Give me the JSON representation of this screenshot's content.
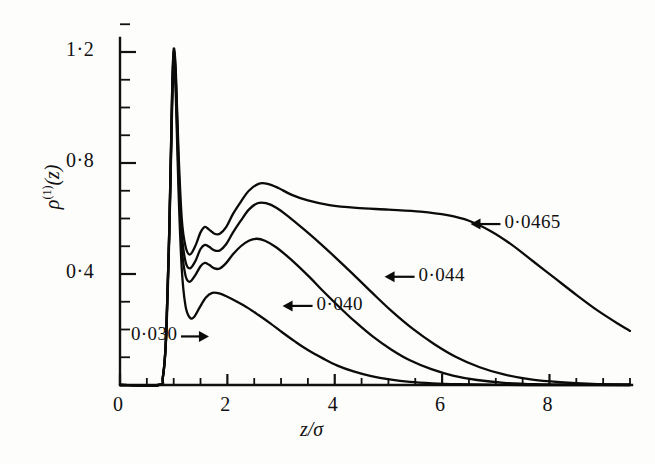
{
  "figure": {
    "name": "density-profile-figure",
    "background": "#fdfdfb",
    "ink_color": "#0b0b0b"
  },
  "axes": {
    "ylabel_rho": "ρ",
    "ylabel_superscript": "(1)",
    "ylabel_arg": "(z)",
    "xlabel": "z/σ",
    "x_ticks_major": [
      "0",
      "2",
      "4",
      "6",
      "8"
    ],
    "y_ticks_major": [
      "0·4",
      "0·8",
      "1·2"
    ]
  },
  "chart_data": {
    "type": "line",
    "title": "",
    "xlabel": "z/σ",
    "ylabel": "ρ(1)(z)",
    "xlim": [
      0,
      9.5
    ],
    "ylim": [
      0,
      1.3
    ],
    "grid": false,
    "legend_position": "inline-arrow-annotations",
    "x_major_ticks": [
      0,
      2,
      4,
      6,
      8
    ],
    "x_minor_tick_step": 0.5,
    "y_major_ticks": [
      0.4,
      0.8,
      1.2
    ],
    "y_minor_tick_step": 0.1,
    "series": [
      {
        "name": "0·0465",
        "label": "0·0465",
        "label_x": 7.05,
        "label_y": 0.58,
        "arrow_direction": "left",
        "points": [
          [
            0.0,
            0.0
          ],
          [
            0.72,
            0.0
          ],
          [
            0.8,
            0.03
          ],
          [
            0.86,
            0.18
          ],
          [
            0.92,
            0.58
          ],
          [
            0.97,
            1.05
          ],
          [
            1.0,
            1.21
          ],
          [
            1.04,
            1.13
          ],
          [
            1.09,
            0.84
          ],
          [
            1.15,
            0.6
          ],
          [
            1.22,
            0.5
          ],
          [
            1.3,
            0.47
          ],
          [
            1.4,
            0.5
          ],
          [
            1.5,
            0.55
          ],
          [
            1.58,
            0.57
          ],
          [
            1.66,
            0.56
          ],
          [
            1.76,
            0.545
          ],
          [
            1.86,
            0.545
          ],
          [
            1.98,
            0.57
          ],
          [
            2.1,
            0.615
          ],
          [
            2.25,
            0.66
          ],
          [
            2.4,
            0.7
          ],
          [
            2.58,
            0.725
          ],
          [
            2.75,
            0.725
          ],
          [
            2.95,
            0.71
          ],
          [
            3.2,
            0.685
          ],
          [
            3.5,
            0.665
          ],
          [
            3.9,
            0.648
          ],
          [
            4.4,
            0.638
          ],
          [
            5.0,
            0.632
          ],
          [
            5.6,
            0.625
          ],
          [
            6.1,
            0.612
          ],
          [
            6.5,
            0.592
          ],
          [
            6.9,
            0.555
          ],
          [
            7.3,
            0.505
          ],
          [
            7.7,
            0.445
          ],
          [
            8.1,
            0.385
          ],
          [
            8.5,
            0.325
          ],
          [
            8.9,
            0.268
          ],
          [
            9.3,
            0.218
          ],
          [
            9.5,
            0.195
          ]
        ]
      },
      {
        "name": "0·044",
        "label": "0·044",
        "label_x": 5.45,
        "label_y": 0.39,
        "arrow_direction": "left",
        "points": [
          [
            0.0,
            0.0
          ],
          [
            0.72,
            0.0
          ],
          [
            0.8,
            0.03
          ],
          [
            0.86,
            0.18
          ],
          [
            0.92,
            0.58
          ],
          [
            0.97,
            1.04
          ],
          [
            1.0,
            1.2
          ],
          [
            1.04,
            1.11
          ],
          [
            1.09,
            0.8
          ],
          [
            1.15,
            0.55
          ],
          [
            1.22,
            0.445
          ],
          [
            1.3,
            0.42
          ],
          [
            1.4,
            0.445
          ],
          [
            1.5,
            0.49
          ],
          [
            1.58,
            0.505
          ],
          [
            1.66,
            0.498
          ],
          [
            1.76,
            0.485
          ],
          [
            1.86,
            0.485
          ],
          [
            1.98,
            0.508
          ],
          [
            2.1,
            0.548
          ],
          [
            2.25,
            0.592
          ],
          [
            2.4,
            0.632
          ],
          [
            2.56,
            0.655
          ],
          [
            2.72,
            0.655
          ],
          [
            2.92,
            0.638
          ],
          [
            3.15,
            0.605
          ],
          [
            3.4,
            0.565
          ],
          [
            3.7,
            0.515
          ],
          [
            4.0,
            0.462
          ],
          [
            4.35,
            0.398
          ],
          [
            4.7,
            0.332
          ],
          [
            5.05,
            0.268
          ],
          [
            5.45,
            0.203
          ],
          [
            5.85,
            0.148
          ],
          [
            6.25,
            0.102
          ],
          [
            6.7,
            0.064
          ],
          [
            7.15,
            0.038
          ],
          [
            7.65,
            0.02
          ],
          [
            8.2,
            0.01
          ],
          [
            8.8,
            0.004
          ],
          [
            9.5,
            0.002
          ]
        ]
      },
      {
        "name": "0·040",
        "label": "0·040",
        "label_x": 3.55,
        "label_y": 0.285,
        "arrow_direction": "left",
        "points": [
          [
            0.0,
            0.0
          ],
          [
            0.72,
            0.0
          ],
          [
            0.8,
            0.03
          ],
          [
            0.86,
            0.18
          ],
          [
            0.92,
            0.57
          ],
          [
            0.97,
            1.02
          ],
          [
            1.0,
            1.185
          ],
          [
            1.04,
            1.09
          ],
          [
            1.09,
            0.76
          ],
          [
            1.15,
            0.5
          ],
          [
            1.22,
            0.395
          ],
          [
            1.3,
            0.372
          ],
          [
            1.4,
            0.395
          ],
          [
            1.5,
            0.428
          ],
          [
            1.58,
            0.44
          ],
          [
            1.66,
            0.433
          ],
          [
            1.76,
            0.42
          ],
          [
            1.86,
            0.42
          ],
          [
            1.98,
            0.44
          ],
          [
            2.1,
            0.47
          ],
          [
            2.25,
            0.5
          ],
          [
            2.4,
            0.52
          ],
          [
            2.55,
            0.527
          ],
          [
            2.7,
            0.52
          ],
          [
            2.88,
            0.5
          ],
          [
            3.08,
            0.47
          ],
          [
            3.3,
            0.432
          ],
          [
            3.55,
            0.385
          ],
          [
            3.8,
            0.335
          ],
          [
            4.08,
            0.282
          ],
          [
            4.38,
            0.228
          ],
          [
            4.7,
            0.176
          ],
          [
            5.05,
            0.128
          ],
          [
            5.4,
            0.089
          ],
          [
            5.8,
            0.057
          ],
          [
            6.2,
            0.034
          ],
          [
            6.65,
            0.018
          ],
          [
            7.15,
            0.008
          ],
          [
            7.75,
            0.003
          ],
          [
            8.5,
            0.001
          ],
          [
            9.5,
            0.0
          ]
        ]
      },
      {
        "name": "0·030",
        "label": "0·030",
        "label_x": 1.62,
        "label_y": 0.175,
        "arrow_direction": "right",
        "points": [
          [
            0.0,
            0.0
          ],
          [
            0.72,
            0.0
          ],
          [
            0.8,
            0.03
          ],
          [
            0.86,
            0.17
          ],
          [
            0.92,
            0.55
          ],
          [
            0.97,
            0.99
          ],
          [
            1.0,
            1.15
          ],
          [
            1.04,
            1.04
          ],
          [
            1.09,
            0.7
          ],
          [
            1.15,
            0.42
          ],
          [
            1.22,
            0.285
          ],
          [
            1.3,
            0.243
          ],
          [
            1.38,
            0.245
          ],
          [
            1.48,
            0.278
          ],
          [
            1.6,
            0.315
          ],
          [
            1.72,
            0.332
          ],
          [
            1.85,
            0.33
          ],
          [
            2.0,
            0.318
          ],
          [
            2.18,
            0.3
          ],
          [
            2.38,
            0.278
          ],
          [
            2.58,
            0.252
          ],
          [
            2.8,
            0.222
          ],
          [
            3.02,
            0.19
          ],
          [
            3.25,
            0.158
          ],
          [
            3.5,
            0.126
          ],
          [
            3.78,
            0.096
          ],
          [
            4.05,
            0.07
          ],
          [
            4.35,
            0.049
          ],
          [
            4.68,
            0.032
          ],
          [
            5.02,
            0.02
          ],
          [
            5.4,
            0.011
          ],
          [
            5.82,
            0.006
          ],
          [
            6.3,
            0.003
          ],
          [
            6.9,
            0.001
          ],
          [
            7.6,
            0.0
          ],
          [
            9.5,
            0.0
          ]
        ]
      }
    ]
  }
}
